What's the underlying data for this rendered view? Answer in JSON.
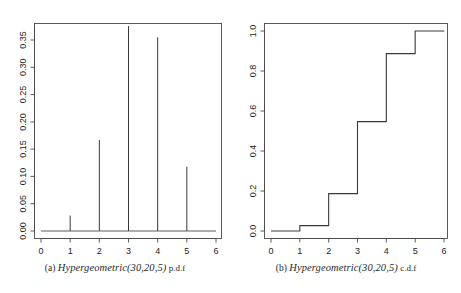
{
  "figure": {
    "background": "#ffffff",
    "line_color": "#3a3a3a",
    "axis_color": "#555555"
  },
  "panels": [
    {
      "id": "a",
      "caption_label": "(a)",
      "caption_dist": "Hypergeometric(30,20,5)",
      "caption_kind": "p.d.f",
      "x_ticks": [
        "0",
        "1",
        "2",
        "3",
        "4",
        "5",
        "6"
      ],
      "y_ticks": [
        "0.00",
        "0.05",
        "0.10",
        "0.15",
        "0.20",
        "0.25",
        "0.30",
        "0.35"
      ]
    },
    {
      "id": "b",
      "caption_label": "(b)",
      "caption_dist": "Hypergeometric(30,20,5)",
      "caption_kind": "c.d.f",
      "x_ticks": [
        "0",
        "1",
        "2",
        "3",
        "4",
        "5",
        "6"
      ],
      "y_ticks": [
        "0.0",
        "0.2",
        "0.4",
        "0.6",
        "0.8",
        "1.0"
      ]
    }
  ],
  "chart_data": [
    {
      "type": "bar",
      "subtype": "spike-pmf",
      "title": "(a) Hypergeometric(30,20,5) p.d.f",
      "xlabel": "",
      "ylabel": "",
      "x": [
        0,
        1,
        2,
        3,
        4,
        5,
        6
      ],
      "categories": [
        "0",
        "1",
        "2",
        "3",
        "4",
        "5",
        "6"
      ],
      "values": [
        0.0,
        0.0271,
        0.1599,
        0.3599,
        0.34,
        0.1128,
        0.0
      ],
      "xlim": [
        0,
        6
      ],
      "ylim": [
        0.0,
        0.36
      ],
      "xticks": [
        0,
        1,
        2,
        3,
        4,
        5,
        6
      ],
      "yticks": [
        0.0,
        0.05,
        0.1,
        0.15,
        0.2,
        0.25,
        0.3,
        0.35
      ],
      "xticklabels": [
        "0",
        "1",
        "2",
        "3",
        "4",
        "5",
        "6"
      ],
      "yticklabels": [
        "0.00",
        "0.05",
        "0.10",
        "0.15",
        "0.20",
        "0.25",
        "0.30",
        "0.35"
      ],
      "grid": false,
      "legend": false
    },
    {
      "type": "line",
      "subtype": "step-cdf",
      "title": "(b) Hypergeometric(30,20,5) c.d.f",
      "xlabel": "",
      "ylabel": "",
      "x": [
        0,
        1,
        2,
        3,
        4,
        5,
        6
      ],
      "categories": [
        "0",
        "1",
        "2",
        "3",
        "4",
        "5",
        "6"
      ],
      "values": [
        0.0,
        0.0271,
        0.187,
        0.5469,
        0.8869,
        0.9997,
        1.0
      ],
      "xlim": [
        0,
        6
      ],
      "ylim": [
        0.0,
        1.0
      ],
      "xticks": [
        0,
        1,
        2,
        3,
        4,
        5,
        6
      ],
      "yticks": [
        0.0,
        0.2,
        0.4,
        0.6,
        0.8,
        1.0
      ],
      "xticklabels": [
        "0",
        "1",
        "2",
        "3",
        "4",
        "5",
        "6"
      ],
      "yticklabels": [
        "0.0",
        "0.2",
        "0.4",
        "0.6",
        "0.8",
        "1.0"
      ],
      "grid": false,
      "legend": false
    }
  ]
}
